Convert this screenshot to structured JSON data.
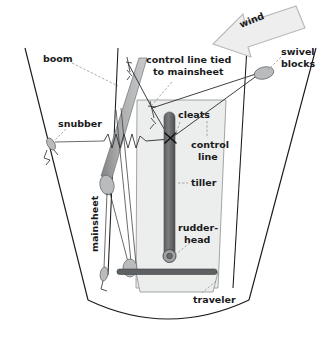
{
  "figure": {
    "background_color": "#ffffff",
    "ink_color": "#1a1a1a"
  },
  "labels": {
    "wind": "wind",
    "boom": "boom",
    "control_line_tied": "control line tied\nto mainsheet",
    "control_line_tied_l1": "control line tied",
    "control_line_tied_l2": "to mainsheet",
    "swivel_blocks": "swivel",
    "swivel_blocks_l2": "blocks",
    "snubber": "snubber",
    "cleats": "cleats",
    "control_line_l1": "control",
    "control_line_l2": "line",
    "tiller": "tiller",
    "rudder_head_l1": "rudder-",
    "rudder_head_l2": "head",
    "mainsheet": "mainsheet",
    "traveler": "traveler"
  },
  "colors": {
    "hull_outline": "#1b1b1b",
    "cockpit_fill": "#eceded",
    "boom_gray": "#9a9c9e",
    "tiller_gray": "#6b6d6f",
    "traveler_gray": "#5e6163",
    "block_gray": "#b9bbbd",
    "wind_arrow_fill": "#eeeeee",
    "leader_line": "#8b8d8f",
    "rope": "#2a2a2a"
  },
  "parts": [
    {
      "name": "wind",
      "kind": "arrow",
      "note": "large hollow arrow pointing down-left at top right"
    },
    {
      "name": "boom",
      "kind": "spar",
      "note": "tapered gray bar angled from upper right to lower left"
    },
    {
      "name": "swivel blocks",
      "kind": "block",
      "note": "oval block on starboard gunwale"
    },
    {
      "name": "snubber",
      "kind": "fitting",
      "note": "small fitting to port with shock-cord zigzag"
    },
    {
      "name": "cleats",
      "kind": "hardware",
      "note": "X marker on tiller"
    },
    {
      "name": "control line",
      "kind": "line",
      "note": "lines running from swivel blocks to cleats on tiller"
    },
    {
      "name": "tiller",
      "kind": "spar",
      "note": "vertical dark rod down the cockpit centerline"
    },
    {
      "name": "rudder-head",
      "kind": "fitting",
      "note": "circular fitting at lower end of tiller"
    },
    {
      "name": "mainsheet",
      "kind": "line",
      "note": "vertical rotated label on port side"
    },
    {
      "name": "traveler",
      "kind": "track",
      "note": "horizontal dark bar across the stern"
    }
  ]
}
